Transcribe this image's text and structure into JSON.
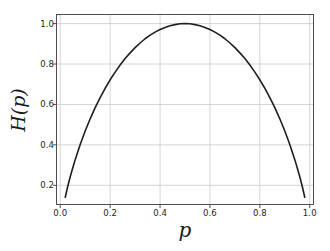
{
  "chart_data": {
    "type": "line",
    "title": "",
    "xlabel": "p",
    "ylabel": "H(p)",
    "xlim": [
      -0.015,
      1.015
    ],
    "ylim": [
      0.105,
      1.045
    ],
    "grid": true,
    "legend": null,
    "xticks": [
      "0.0",
      "0.2",
      "0.4",
      "0.6",
      "0.8",
      "1.0"
    ],
    "xtick_values": [
      0.0,
      0.2,
      0.4,
      0.6,
      0.8,
      1.0
    ],
    "yticks": [
      "0.2",
      "0.4",
      "0.6",
      "0.8",
      "1.0"
    ],
    "ytick_values": [
      0.2,
      0.4,
      0.6,
      0.8,
      1.0
    ],
    "series": [
      {
        "name": "binary entropy",
        "color": "#1f1f1f",
        "linewidth": 1.6,
        "x": [
          0.02,
          0.03,
          0.04,
          0.05,
          0.06,
          0.08,
          0.1,
          0.12,
          0.14,
          0.16,
          0.18,
          0.2,
          0.22,
          0.24,
          0.26,
          0.28,
          0.3,
          0.32,
          0.34,
          0.36,
          0.38,
          0.4,
          0.42,
          0.44,
          0.46,
          0.48,
          0.5,
          0.52,
          0.54,
          0.56,
          0.58,
          0.6,
          0.62,
          0.64,
          0.66,
          0.68,
          0.7,
          0.72,
          0.74,
          0.76,
          0.78,
          0.8,
          0.82,
          0.84,
          0.86,
          0.88,
          0.9,
          0.92,
          0.94,
          0.95,
          0.96,
          0.97,
          0.98
        ],
        "y": [
          0.141,
          0.194,
          0.242,
          0.286,
          0.327,
          0.402,
          0.469,
          0.529,
          0.584,
          0.634,
          0.68,
          0.722,
          0.76,
          0.795,
          0.827,
          0.855,
          0.881,
          0.904,
          0.925,
          0.943,
          0.958,
          0.971,
          0.981,
          0.989,
          0.995,
          0.999,
          1.0,
          0.999,
          0.995,
          0.989,
          0.981,
          0.971,
          0.958,
          0.943,
          0.925,
          0.904,
          0.881,
          0.855,
          0.827,
          0.795,
          0.76,
          0.722,
          0.68,
          0.634,
          0.584,
          0.529,
          0.469,
          0.402,
          0.327,
          0.286,
          0.242,
          0.194,
          0.141
        ]
      }
    ],
    "axes": {
      "frame_color": "#4d4d4d",
      "grid_color": "#c9c9c9",
      "background": "#ffffff",
      "tick_color": "#4d4d4d"
    }
  }
}
